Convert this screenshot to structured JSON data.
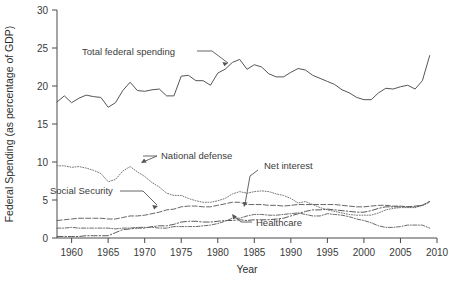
{
  "chart_data": {
    "type": "line",
    "title": "",
    "xlabel": "Year",
    "ylabel": "Federal Spending (as percentage of GDP)",
    "xlim": [
      1958,
      2010
    ],
    "ylim": [
      0,
      30
    ],
    "xticks": [
      1960,
      1965,
      1970,
      1975,
      1980,
      1985,
      1990,
      1995,
      2000,
      2005,
      2010
    ],
    "yticks": [
      0,
      5,
      10,
      15,
      20,
      25,
      30
    ],
    "grid": false,
    "legend_position": "inline-annotations",
    "x": [
      1958,
      1959,
      1960,
      1961,
      1962,
      1963,
      1964,
      1965,
      1966,
      1967,
      1968,
      1969,
      1970,
      1971,
      1972,
      1973,
      1974,
      1975,
      1976,
      1977,
      1978,
      1979,
      1980,
      1981,
      1982,
      1983,
      1984,
      1985,
      1986,
      1987,
      1988,
      1989,
      1990,
      1991,
      1992,
      1993,
      1994,
      1995,
      1996,
      1997,
      1998,
      1999,
      2000,
      2001,
      2002,
      2003,
      2004,
      2005,
      2006,
      2007,
      2008,
      2009
    ],
    "series": [
      {
        "name": "Total federal spending",
        "style": "solid",
        "color": "#555555",
        "values": [
          17.9,
          18.7,
          17.8,
          18.4,
          18.8,
          18.6,
          18.5,
          17.2,
          17.8,
          19.4,
          20.5,
          19.4,
          19.3,
          19.5,
          19.6,
          18.7,
          18.7,
          21.3,
          21.4,
          20.7,
          20.7,
          20.1,
          21.7,
          22.2,
          23.1,
          23.5,
          22.2,
          22.8,
          22.5,
          21.6,
          21.2,
          21.2,
          21.8,
          22.3,
          22.1,
          21.4,
          21.0,
          20.6,
          20.2,
          19.5,
          19.1,
          18.5,
          18.2,
          18.2,
          19.1,
          19.7,
          19.6,
          19.9,
          20.1,
          19.6,
          20.7,
          24.0
        ]
      },
      {
        "name": "National defense",
        "style": "dotted",
        "color": "#777777",
        "values": [
          9.5,
          9.5,
          9.3,
          9.4,
          9.2,
          8.9,
          8.5,
          7.4,
          7.7,
          8.8,
          9.4,
          8.7,
          8.1,
          7.3,
          6.7,
          5.9,
          5.6,
          5.6,
          5.2,
          4.9,
          4.7,
          4.7,
          4.9,
          5.2,
          5.8,
          6.1,
          5.9,
          6.1,
          6.2,
          6.1,
          5.8,
          5.6,
          5.2,
          4.6,
          4.8,
          4.4,
          4.0,
          3.7,
          3.5,
          3.3,
          3.1,
          3.0,
          3.0,
          3.0,
          3.3,
          3.7,
          3.9,
          4.0,
          4.0,
          4.0,
          4.3,
          4.7
        ]
      },
      {
        "name": "Social Security",
        "style": "dashed",
        "color": "#666666",
        "values": [
          2.3,
          2.4,
          2.5,
          2.6,
          2.6,
          2.6,
          2.6,
          2.5,
          2.5,
          2.7,
          2.9,
          2.9,
          3.0,
          3.2,
          3.4,
          3.7,
          3.8,
          4.1,
          4.2,
          4.2,
          4.1,
          4.1,
          4.3,
          4.5,
          4.7,
          4.7,
          4.4,
          4.4,
          4.4,
          4.3,
          4.3,
          4.2,
          4.3,
          4.4,
          4.4,
          4.4,
          4.4,
          4.4,
          4.4,
          4.3,
          4.2,
          4.1,
          4.1,
          4.2,
          4.3,
          4.3,
          4.2,
          4.2,
          4.1,
          4.2,
          4.3,
          4.8
        ]
      },
      {
        "name": "Healthcare",
        "style": "dash-dot",
        "color": "#5a5a5a",
        "values": [
          0.2,
          0.2,
          0.2,
          0.2,
          0.3,
          0.3,
          0.3,
          0.3,
          0.7,
          1.1,
          1.2,
          1.3,
          1.3,
          1.5,
          1.6,
          1.6,
          1.8,
          2.1,
          2.2,
          2.2,
          2.1,
          2.1,
          2.2,
          2.3,
          2.3,
          2.4,
          2.3,
          2.4,
          2.4,
          2.4,
          2.5,
          2.6,
          2.9,
          3.2,
          3.5,
          3.7,
          3.7,
          3.8,
          3.7,
          3.6,
          3.5,
          3.4,
          3.4,
          3.6,
          3.9,
          4.1,
          4.1,
          4.1,
          4.1,
          4.1,
          4.3,
          4.8
        ]
      },
      {
        "name": "Net interest",
        "style": "dash-dot-dense",
        "color": "#6b6b6b",
        "values": [
          1.3,
          1.3,
          1.4,
          1.3,
          1.3,
          1.3,
          1.3,
          1.3,
          1.2,
          1.3,
          1.3,
          1.4,
          1.4,
          1.4,
          1.3,
          1.3,
          1.5,
          1.5,
          1.5,
          1.5,
          1.6,
          1.7,
          1.9,
          2.2,
          2.6,
          2.6,
          2.9,
          3.1,
          3.1,
          3.0,
          3.0,
          3.1,
          3.2,
          3.3,
          3.1,
          2.9,
          2.9,
          3.2,
          3.1,
          3.0,
          2.8,
          2.5,
          2.3,
          2.0,
          1.6,
          1.4,
          1.4,
          1.5,
          1.7,
          1.7,
          1.7,
          1.3
        ]
      }
    ],
    "annotations": [
      {
        "name": "total-federal-spending",
        "label": "Total federal spending"
      },
      {
        "name": "national-defense",
        "label": "National defense"
      },
      {
        "name": "social-security",
        "label": "Social Security"
      },
      {
        "name": "net-interest",
        "label": "Net interest"
      },
      {
        "name": "healthcare",
        "label": "Healthcare"
      }
    ]
  },
  "axis": {
    "y_title": "Federal Spending (as percentage of GDP)",
    "x_title": "Year",
    "y_tick_labels": [
      "0",
      "5",
      "10",
      "15",
      "20",
      "25",
      "30"
    ],
    "x_tick_labels": [
      "1960",
      "1965",
      "1970",
      "1975",
      "1980",
      "1985",
      "1990",
      "1995",
      "2000",
      "2005",
      "2010"
    ]
  },
  "labels": {
    "total_federal_spending": "Total federal spending",
    "national_defense": "National defense",
    "social_security": "Social Security",
    "net_interest": "Net interest",
    "healthcare": "Healthcare"
  },
  "colors": {
    "axis": "#4a4a4a",
    "total": "#555555",
    "defense": "#777777",
    "social": "#666666",
    "health": "#5a5a5a",
    "interest": "#6b6b6b",
    "text": "#333333"
  }
}
